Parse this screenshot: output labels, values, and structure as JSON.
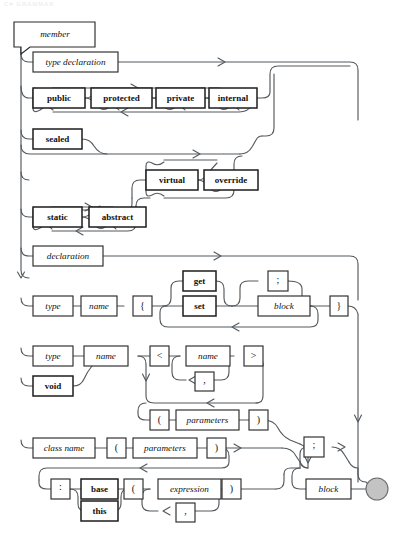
{
  "page": {
    "title": "member",
    "kind": "railroad-syntax-diagram",
    "ghost_header": "C# GRAMMAR"
  },
  "colors": {
    "rail": "#555a5e",
    "box_stroke": "#2b2b2b",
    "box_fill": "#ffffff",
    "text": "#111111",
    "terminator_fill": "#c3c3c3",
    "terminator_stroke": "#6d6d6d",
    "background": "#ffffff"
  },
  "start": {
    "label": "member"
  },
  "end": {
    "label": "terminator"
  },
  "nodes": {
    "type_declaration": "type declaration",
    "public": "public",
    "protected": "protected",
    "private": "private",
    "internal": "internal",
    "sealed": "sealed",
    "virtual": "virtual",
    "override": "override",
    "static": "static",
    "abstract": "abstract",
    "declaration": "declaration",
    "type": "type",
    "name": "name",
    "brace_open": "{",
    "get": "get",
    "set": "set",
    "semicolon": ";",
    "block": "block",
    "brace_close": "}",
    "type2": "type",
    "void": "void",
    "name2": "name",
    "angle_open": "<",
    "name3": "name",
    "comma": ",",
    "angle_close": ">",
    "paren_open": "(",
    "parameters": "parameters",
    "paren_close": ")",
    "class_name": "class name",
    "paren_open2": "(",
    "parameters2": "parameters",
    "paren_close2": ")",
    "colon": ":",
    "base": "base",
    "this": "this",
    "paren_open3": "(",
    "expression": "expression",
    "comma2": ",",
    "paren_close3": ")",
    "semicolon2": ";",
    "block2": "block"
  },
  "rows": [
    {
      "name": "type-declaration-row",
      "items": [
        "type declaration"
      ]
    },
    {
      "name": "access-modifier-row",
      "items": [
        "public",
        "protected",
        "private",
        "internal"
      ]
    },
    {
      "name": "sealed-row",
      "items": [
        "sealed"
      ]
    },
    {
      "name": "virtual-override-row",
      "items": [
        "virtual",
        "override"
      ]
    },
    {
      "name": "static-abstract-row",
      "items": [
        "static",
        "abstract"
      ]
    },
    {
      "name": "declaration-row",
      "items": [
        "declaration"
      ]
    },
    {
      "name": "property-row",
      "items": [
        "type",
        "name",
        "{",
        "get",
        "set",
        ";",
        "block",
        "}"
      ]
    },
    {
      "name": "method-row",
      "items": [
        "type",
        "void",
        "name",
        "<",
        "name",
        ",",
        ">",
        "(",
        "parameters",
        ")"
      ]
    },
    {
      "name": "constructor-row",
      "items": [
        "class name",
        "(",
        "parameters",
        ")"
      ]
    },
    {
      "name": "initializer-row",
      "items": [
        ":",
        "base",
        "this",
        "(",
        "expression",
        ",",
        ")"
      ]
    },
    {
      "name": "body-row",
      "items": [
        ";",
        "block"
      ]
    }
  ]
}
